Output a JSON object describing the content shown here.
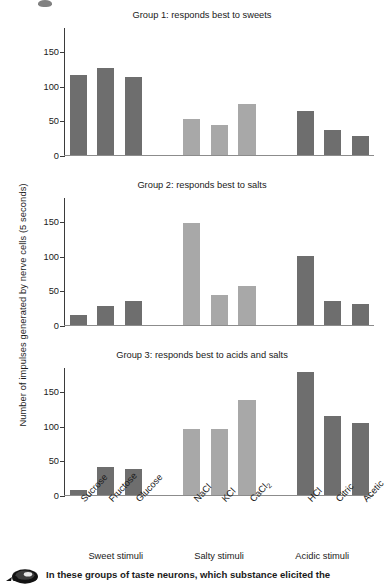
{
  "figure": {
    "y_axis_title": "Number of impulses generated by nerve cells (5 seconds)",
    "top_mark_icon": "pencil-tip-mark-icon"
  },
  "caption": {
    "icon": "mouse-icon",
    "text": "In these groups of taste neurons, which substance elicited the"
  },
  "group_labels": [
    {
      "label": "Sweet stimuli",
      "center_pct": 16.7
    },
    {
      "label": "Salty stimuli",
      "center_pct": 50.0
    },
    {
      "label": "Acidic stimuli",
      "center_pct": 83.3
    }
  ],
  "chart_data": {
    "type": "bar",
    "xlabel": "",
    "ylabel": "Number of impulses generated by nerve cells (5 seconds)",
    "ylim": [
      0,
      185
    ],
    "yticks": [
      0,
      50,
      100,
      150
    ],
    "grid": false,
    "legend": false,
    "categories": [
      "Sucrose",
      "Fructose",
      "Glucose",
      "NaCl",
      "KCl",
      "CaCl2",
      "HCl",
      "Citric",
      "Acetic"
    ],
    "category_labels": [
      "Sucrose",
      "Fructose",
      "Glucose",
      "NaCl",
      "KCl",
      "CaCl₂",
      "HCl",
      "Citric",
      "Acetic"
    ],
    "category_groups": [
      "Sweet stimuli",
      "Sweet stimuli",
      "Sweet stimuli",
      "Salty stimuli",
      "Salty stimuli",
      "Salty stimuli",
      "Acidic stimuli",
      "Acidic stimuli",
      "Acidic stimuli"
    ],
    "bar_colors": [
      "#6e6e6e",
      "#6e6e6e",
      "#6e6e6e",
      "#a8a8a8",
      "#a8a8a8",
      "#a8a8a8",
      "#6e6e6e",
      "#6e6e6e",
      "#6e6e6e"
    ],
    "panels": [
      {
        "title": "Group 1: responds best to sweets",
        "values": [
          115,
          126,
          113,
          52,
          44,
          74,
          63,
          36,
          27
        ]
      },
      {
        "title": "Group 2: responds best to salts",
        "values": [
          14,
          27,
          34,
          148,
          43,
          57,
          100,
          35,
          31
        ]
      },
      {
        "title": "Group 3: responds best to acids and salts",
        "values": [
          7,
          40,
          38,
          96,
          96,
          138,
          178,
          114,
          104
        ]
      }
    ]
  }
}
